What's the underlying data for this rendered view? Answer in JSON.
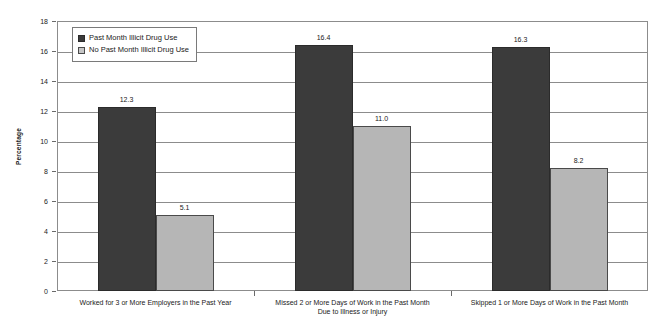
{
  "chart_data": {
    "type": "bar",
    "title": "",
    "xlabel": "",
    "ylabel": "Percentage",
    "ylim": [
      0,
      18
    ],
    "ytick_step": 2,
    "yticks": [
      "18",
      "16",
      "14",
      "12",
      "10",
      "8",
      "6",
      "4",
      "2",
      "0"
    ],
    "grid": true,
    "legend_position": "top-left-inside",
    "categories": [
      "Worked for 3 or More Employers in the Past Year",
      "Missed 2 or More Days of Work in the Past Month\nDue to Illness or Injury",
      "Skipped 1 or More Days of Work in the Past Month"
    ],
    "category_lines": [
      [
        "Worked for 3 or More Employers in the Past Year"
      ],
      [
        "Missed 2 or More Days of Work in the Past Month",
        "Due to Illness or Injury"
      ],
      [
        "Skipped 1 or More Days of Work in the Past Month"
      ]
    ],
    "series": [
      {
        "name": "Past Month Illicit Drug Use",
        "color": "#3b3b3b",
        "values": [
          12.3,
          16.4,
          16.3
        ],
        "labels": [
          "12.3",
          "16.4",
          "16.3"
        ]
      },
      {
        "name": "No Past Month Illicit Drug Use",
        "color": "#b6b6b6",
        "values": [
          5.1,
          11.0,
          8.2
        ],
        "labels": [
          "5.1",
          "11.0",
          "8.2"
        ]
      }
    ]
  },
  "legend": {
    "items": [
      {
        "label": "Past Month Illicit Drug Use",
        "swatch": "dark-swatch-icon"
      },
      {
        "label": "No Past Month Illicit Drug Use",
        "swatch": "light-swatch-icon"
      }
    ]
  },
  "axes": {
    "y_title": "Percentage"
  }
}
